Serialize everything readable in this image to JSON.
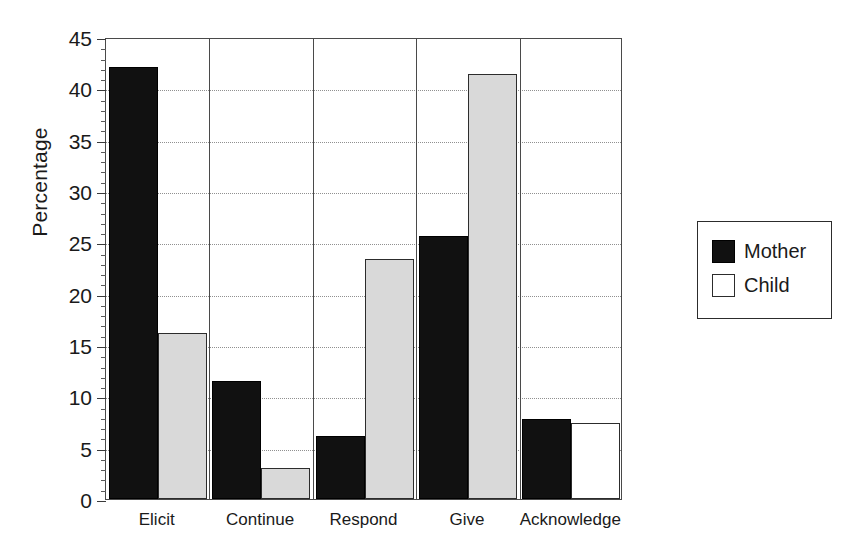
{
  "chart_data": {
    "type": "bar",
    "title": "",
    "xlabel": "",
    "ylabel": "Percentage",
    "ylim": [
      0,
      45
    ],
    "ytick_step": 5,
    "yticks": [
      "0",
      "5",
      "10",
      "15",
      "20",
      "25",
      "30",
      "35",
      "40",
      "45"
    ],
    "minor_tick_step": 1,
    "grid": "horizontal-dotted",
    "legend_position": "right-outside",
    "categories": [
      "Elicit",
      "Continue",
      "Respond",
      "Give",
      "Acknowledge"
    ],
    "series": [
      {
        "name": "Mother",
        "color": "#111111",
        "fill": "solid-black",
        "values": [
          42.1,
          11.5,
          6.1,
          25.6,
          7.8
        ]
      },
      {
        "name": "Child",
        "color": "#d9d9d9",
        "fill": "light-gray",
        "values": [
          16.2,
          3.0,
          23.4,
          41.4,
          7.4
        ]
      }
    ]
  },
  "legend": {
    "items": [
      {
        "label": "Mother",
        "swatch": "filled"
      },
      {
        "label": "Child",
        "swatch": "empty"
      }
    ]
  }
}
